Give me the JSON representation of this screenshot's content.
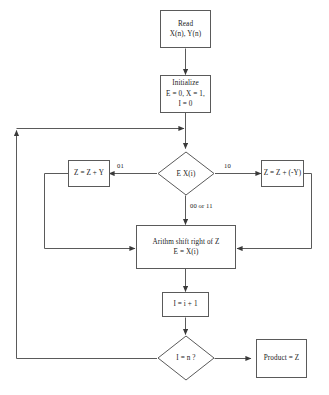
{
  "diagram": {
    "stroke_color": "#5a5a5a",
    "text_color": "#1a1a1a",
    "background_color": "#ffffff",
    "nodes": {
      "read": {
        "shape": "process",
        "line1": "Read",
        "line2": "X(n), Y(n)"
      },
      "initialize": {
        "shape": "process",
        "line1": "Initialize",
        "line2": "E = 0, X = 1,",
        "line3": "I = 0"
      },
      "test_bits": {
        "shape": "decision",
        "label": "E X(i)"
      },
      "add_y": {
        "shape": "process",
        "label": "Z = Z + Y"
      },
      "sub_y": {
        "shape": "process",
        "label": "Z = Z + (-Y)"
      },
      "shift": {
        "shape": "process",
        "line1": "Arithm shift right of Z",
        "line2": "E = X(i)"
      },
      "increment": {
        "shape": "process",
        "label": "I = i + 1"
      },
      "check_done": {
        "shape": "decision",
        "label": "I = n ?"
      },
      "product": {
        "shape": "process",
        "label": "Product = Z"
      }
    },
    "edge_labels": {
      "left_branch": "01",
      "right_branch": "10",
      "down_branch": "00 or 11"
    }
  }
}
